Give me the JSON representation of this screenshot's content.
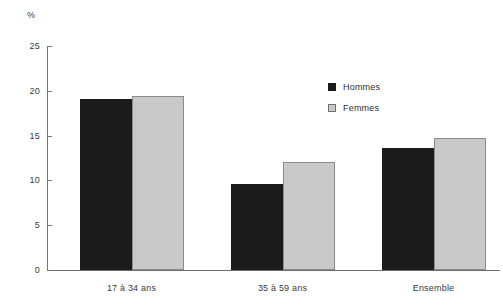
{
  "chart_data": {
    "type": "bar",
    "title": "",
    "subtitle": "",
    "xlabel": "",
    "ylabel": "%",
    "unit_label": "%",
    "categories": [
      "17 à 34 ans",
      "35 à 59 ans",
      "Ensemble"
    ],
    "series": [
      {
        "name": "Hommes",
        "color": "#1b1b1b",
        "values": [
          19.1,
          9.6,
          13.6
        ]
      },
      {
        "name": "Femmes",
        "color": "#c9c9c9",
        "values": [
          19.4,
          12.0,
          14.7
        ]
      }
    ],
    "ylim": [
      0,
      25
    ],
    "ytick_labels": [
      "0",
      "5",
      "10",
      "15",
      "20",
      "25"
    ],
    "ytick_values": [
      0,
      5,
      10,
      15,
      20,
      25
    ],
    "grid": false,
    "legend_position": "top-right",
    "legend_entries": [
      "Hommes",
      "Femmes"
    ],
    "annotations": []
  },
  "axis": {
    "unit": "%",
    "ticks": [
      {
        "label": "0"
      },
      {
        "label": "5"
      },
      {
        "label": "10"
      },
      {
        "label": "15"
      },
      {
        "label": "20"
      },
      {
        "label": "25"
      }
    ]
  },
  "groups": [
    {
      "label": "17 à 34 ans"
    },
    {
      "label": "35 à 59 ans"
    },
    {
      "label": "Ensemble"
    }
  ],
  "legend": {
    "items": [
      {
        "label": "Hommes"
      },
      {
        "label": "Femmes"
      }
    ]
  }
}
